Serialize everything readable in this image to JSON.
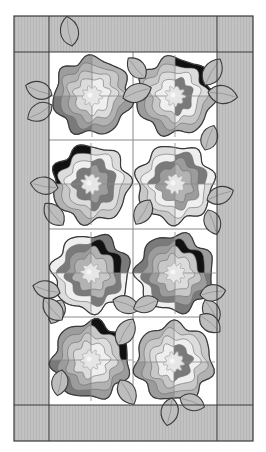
{
  "canvas": {
    "width": 266,
    "height": 452
  },
  "colors": {
    "background": "#ffffff",
    "border_fabric": "#c2c2c2",
    "border_stripe": "#b4b4b4",
    "outline": "#3a3a3a",
    "grid_line": "#8a8a8a",
    "block_bg": "#ffffff",
    "leaf_fill": "#bdbdbd",
    "leaf_vein": "#8e8e8e",
    "center_fill": "#e6e6e6",
    "shades": [
      "#7a7a7a",
      "#9c9c9c",
      "#b2b2b2",
      "#c8c8c8",
      "#dcdcdc",
      "#efefef"
    ],
    "dark": "#111111"
  },
  "quilt": {
    "outer": {
      "x": 14,
      "y": 16,
      "w": 239,
      "h": 425
    },
    "inner": {
      "x": 49,
      "y": 52,
      "w": 168,
      "h": 353
    },
    "columns_x": [
      133
    ],
    "rows_y": [
      140,
      229,
      317
    ],
    "block_subdivisions": true
  },
  "flowers": [
    {
      "id": 1,
      "cx": 92,
      "cy": 96,
      "r": 38,
      "dark_quadrant": "none",
      "dark_inner": "none"
    },
    {
      "id": 2,
      "cx": 175,
      "cy": 96,
      "r": 38,
      "dark_quadrant": "tr",
      "dark_inner": "none"
    },
    {
      "id": 3,
      "cx": 91,
      "cy": 184,
      "r": 38,
      "dark_quadrant": "tl",
      "dark_inner": "none"
    },
    {
      "id": 4,
      "cx": 175,
      "cy": 184,
      "r": 38,
      "dark_quadrant": "none",
      "dark_inner": "none"
    },
    {
      "id": 5,
      "cx": 91,
      "cy": 273,
      "r": 38,
      "dark_quadrant": "none",
      "dark_inner": "tr"
    },
    {
      "id": 6,
      "cx": 175,
      "cy": 273,
      "r": 38,
      "dark_quadrant": "none",
      "dark_inner": "tr"
    },
    {
      "id": 7,
      "cx": 91,
      "cy": 360,
      "r": 38,
      "dark_quadrant": "tr",
      "dark_inner": "none"
    },
    {
      "id": 8,
      "cx": 174,
      "cy": 362,
      "r": 38,
      "dark_quadrant": "none",
      "dark_inner": "none"
    }
  ],
  "leaves": [
    {
      "x": 72,
      "y": 46,
      "len": 30,
      "w": 20,
      "angle": -100
    },
    {
      "x": 52,
      "y": 95,
      "len": 28,
      "w": 19,
      "angle": 200
    },
    {
      "x": 52,
      "y": 105,
      "len": 28,
      "w": 19,
      "angle": 150
    },
    {
      "x": 123,
      "y": 98,
      "len": 30,
      "w": 20,
      "angle": -20
    },
    {
      "x": 145,
      "y": 78,
      "len": 26,
      "w": 18,
      "angle": 230
    },
    {
      "x": 205,
      "y": 85,
      "len": 30,
      "w": 20,
      "angle": -60
    },
    {
      "x": 208,
      "y": 92,
      "len": 30,
      "w": 20,
      "angle": 10
    },
    {
      "x": 58,
      "y": 188,
      "len": 28,
      "w": 19,
      "angle": 190
    },
    {
      "x": 205,
      "y": 150,
      "len": 26,
      "w": 18,
      "angle": -70
    },
    {
      "x": 207,
      "y": 200,
      "len": 28,
      "w": 19,
      "angle": -20
    },
    {
      "x": 208,
      "y": 210,
      "len": 26,
      "w": 18,
      "angle": 70
    },
    {
      "x": 150,
      "y": 200,
      "len": 28,
      "w": 19,
      "angle": 120
    },
    {
      "x": 63,
      "y": 225,
      "len": 28,
      "w": 19,
      "angle": 230
    },
    {
      "x": 60,
      "y": 293,
      "len": 28,
      "w": 19,
      "angle": 195
    },
    {
      "x": 62,
      "y": 300,
      "len": 26,
      "w": 18,
      "angle": 115
    },
    {
      "x": 113,
      "y": 300,
      "len": 28,
      "w": 19,
      "angle": 20
    },
    {
      "x": 205,
      "y": 300,
      "len": 26,
      "w": 18,
      "angle": 60
    },
    {
      "x": 200,
      "y": 315,
      "len": 26,
      "w": 18,
      "angle": 40
    },
    {
      "x": 200,
      "y": 295,
      "len": 26,
      "w": 18,
      "angle": -10
    },
    {
      "x": 158,
      "y": 300,
      "len": 26,
      "w": 18,
      "angle": 160
    },
    {
      "x": 62,
      "y": 320,
      "len": 28,
      "w": 19,
      "angle": 230
    },
    {
      "x": 62,
      "y": 370,
      "len": 26,
      "w": 18,
      "angle": 100
    },
    {
      "x": 118,
      "y": 345,
      "len": 30,
      "w": 20,
      "angle": -60
    },
    {
      "x": 120,
      "y": 380,
      "len": 28,
      "w": 19,
      "angle": 60
    },
    {
      "x": 172,
      "y": 398,
      "len": 28,
      "w": 19,
      "angle": 100
    },
    {
      "x": 180,
      "y": 398,
      "len": 26,
      "w": 18,
      "angle": 20
    }
  ]
}
